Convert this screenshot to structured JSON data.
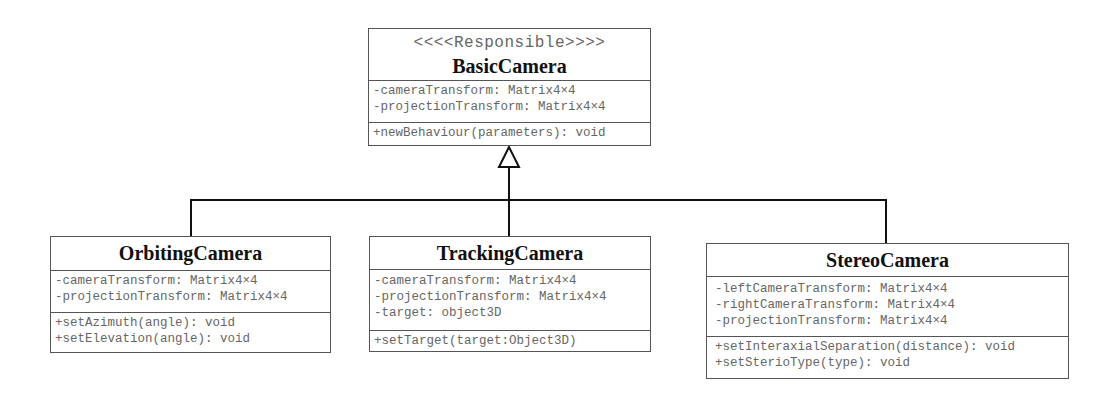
{
  "diagram": {
    "type": "uml-class-inheritance",
    "base": {
      "stereotype": "<<<<Responsible>>>>",
      "name": "BasicCamera",
      "attributes": [
        "-cameraTransform: Matrix4×4",
        "-projectionTransform: Matrix4×4"
      ],
      "methods": [
        "+newBehaviour(parameters): void"
      ]
    },
    "subclasses": [
      {
        "name": "OrbitingCamera",
        "attributes": [
          "-cameraTransform: Matrix4×4",
          "-projectionTransform: Matrix4×4"
        ],
        "methods": [
          "+setAzimuth(angle): void",
          "+setElevation(angle): void"
        ]
      },
      {
        "name": "TrackingCamera",
        "attributes": [
          "-cameraTransform: Matrix4×4",
          "-projectionTransform: Matrix4×4",
          "-target: object3D"
        ],
        "methods": [
          "+setTarget(target:Object3D)"
        ]
      },
      {
        "name": "StereoCamera",
        "attributes": [
          "-leftCameraTransform: Matrix4×4",
          "-rightCameraTransform: Matrix4×4",
          "-projectionTransform: Matrix4×4"
        ],
        "methods": [
          "+setInteraxialSeparation(distance): void",
          "+setSterioType(type): void"
        ]
      }
    ],
    "relationship": "generalization",
    "line_color": "#111111",
    "border_color": "#555555",
    "text_color": "#666666"
  }
}
